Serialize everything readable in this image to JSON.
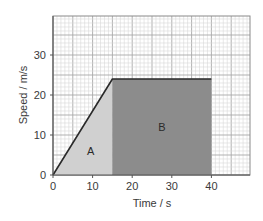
{
  "chart_data": {
    "type": "area",
    "title": "",
    "xlabel": "Time / s",
    "ylabel": "Speed / m/s",
    "xlim": [
      0,
      50
    ],
    "ylim": [
      0,
      40
    ],
    "x_ticks": [
      0,
      10,
      20,
      30,
      40
    ],
    "y_ticks": [
      0,
      10,
      20,
      30
    ],
    "grid": true,
    "series": [
      {
        "name": "speed-time",
        "x": [
          0,
          15,
          40
        ],
        "y": [
          0,
          24,
          24
        ]
      }
    ],
    "regions": [
      {
        "label": "A",
        "shape": "triangle",
        "points": [
          [
            0,
            0
          ],
          [
            15,
            24
          ],
          [
            15,
            0
          ]
        ],
        "color": "#d0d0d0"
      },
      {
        "label": "B",
        "shape": "rectangle",
        "points": [
          [
            15,
            0
          ],
          [
            15,
            24
          ],
          [
            40,
            24
          ],
          [
            40,
            0
          ]
        ],
        "color": "#8c8c8c"
      }
    ],
    "colors": {
      "line": "#2a2a2a",
      "grid_minor": "#d8d8d8",
      "grid_major": "#a8a8a8",
      "axis": "#555555"
    }
  }
}
